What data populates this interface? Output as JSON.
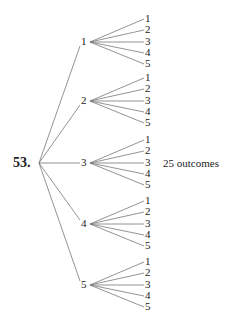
{
  "problem_number": "53.",
  "result_label": "25 outcomes",
  "tree": {
    "root": {
      "x": 39,
      "y": 163
    },
    "first_level": [
      {
        "label": "1",
        "y": 42
      },
      {
        "label": "2",
        "y": 101
      },
      {
        "label": "3",
        "y": 163
      },
      {
        "label": "4",
        "y": 224
      },
      {
        "label": "5",
        "y": 285
      }
    ],
    "second_level_labels": [
      "1",
      "2",
      "3",
      "4",
      "5"
    ],
    "second_level_offsets": [
      -23,
      -12,
      0,
      11,
      22
    ]
  },
  "colors": {
    "line": "#777777",
    "text": "#222222"
  }
}
